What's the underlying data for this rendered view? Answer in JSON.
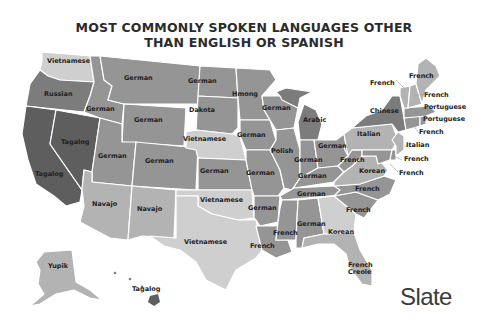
{
  "title": {
    "line1": "MOST COMMONLY SPOKEN LANGUAGES OTHER",
    "line2": "THAN ENGLISH OR SPANISH"
  },
  "colors": {
    "darkest": "#5e5e5e",
    "dark": "#7c7c7c",
    "medium": "#959595",
    "light": "#b3b3b3",
    "lightest": "#cfcfcf",
    "background": "#ffffff",
    "border": "#ffffff"
  },
  "states": {
    "WA": "Vietnamese",
    "OR": "Russian",
    "CA": "Tagalog",
    "NV": "Tagalog",
    "ID": "German",
    "MT": "German",
    "WY": "German",
    "UT": "German",
    "CO": "German",
    "AZ": "Navajo",
    "NM": "Navajo",
    "ND": "German",
    "SD": "Dakota",
    "NE": "Vietnamese",
    "KS": "German",
    "OK": "Vietnamese",
    "TX": "Vietnamese",
    "MN": "Hmong",
    "IA": "German",
    "MO": "German",
    "AR": "German",
    "LA": "French",
    "WI": "German",
    "IL": "Polish",
    "MI": "Arabic",
    "IN": "German",
    "OH": "German",
    "KY": "German",
    "TN": "German",
    "MS": "French",
    "AL": "German",
    "GA": "Korean",
    "FL": "French Creole",
    "SC": "French",
    "NC": "French",
    "VA": "Korean",
    "WV": "French",
    "PA": "Italian",
    "NY": "Chinese",
    "VT": "French",
    "NH": "French",
    "ME": "French",
    "MA": "Portuguese",
    "RI": "Portuguese",
    "CT": "French",
    "NJ": "Italian",
    "DE": "French",
    "MD": "French",
    "AK": "Yupik",
    "HI": "Tagalog"
  },
  "labels": {
    "wa": "Vietnamese",
    "or": "Russian",
    "ca": "Tagalog",
    "nv": "Tagalog",
    "id": "German",
    "mt": "German",
    "wy": "German",
    "ut": "German",
    "co": "German",
    "az": "Navajo",
    "nm": "Navajo",
    "nd": "German",
    "sd": "Dakota",
    "ne": "Vietnamese",
    "ks": "German",
    "ok": "Vietnamese",
    "tx": "Vietnamese",
    "mn": "Hmong",
    "ia": "German",
    "mo": "German",
    "ar": "German",
    "la": "French",
    "wi": "German",
    "il": "Polish",
    "mi": "Arabic",
    "in": "German",
    "oh": "German",
    "ky": "German",
    "tn": "German",
    "ms": "French",
    "al": "German",
    "ga": "Korean",
    "fl1": "French",
    "fl2": "Creole",
    "sc": "French",
    "nc": "French",
    "va": "Korean",
    "wv": "French",
    "pa": "Italian",
    "ny": "Chinese",
    "vt": "French",
    "nh": "French",
    "me": "French",
    "ma": "Portuguese",
    "ri": "Portuguese",
    "ct": "French",
    "nj": "Italian",
    "de": "French",
    "md": "French",
    "ak": "Yupik",
    "hi": "Tagalog"
  },
  "logo": "Slate"
}
